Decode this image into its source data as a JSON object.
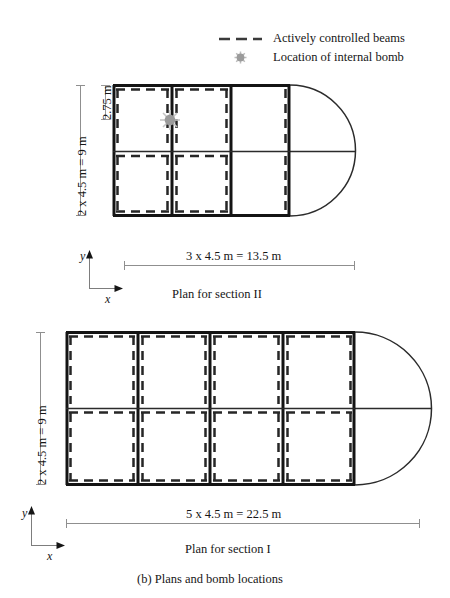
{
  "figure": {
    "caption": "(b) Plans and bomb locations",
    "legend": [
      {
        "label": "Actively controlled beams",
        "marker": "dashed-line-swatch"
      },
      {
        "label": "Location of internal bomb",
        "marker": "bomb-starburst-icon"
      }
    ],
    "colors": {
      "line": "#161616",
      "thin_line": "#2b2b2b",
      "dimension_line": "#8a8a8a",
      "bomb_marker": "#9b9b9b",
      "legend_dash": "#3a3a3a",
      "background": "#ffffff"
    },
    "plans": [
      {
        "id": "section-II",
        "title": "Plan for section II",
        "horizontal_dimension": "3 x 4.5 m = 13.5 m",
        "vertical_dimension": "2 x 4.5 m = 9 m",
        "offset_dimension": "2.75 m",
        "bays_x": 2,
        "bays_y": 2,
        "has_round_end": true,
        "bomb_count": 1,
        "axis": {
          "y": "y",
          "x": "x"
        }
      },
      {
        "id": "section-I",
        "title": "Plan for section I",
        "horizontal_dimension": "5 x 4.5 m = 22.5 m",
        "vertical_dimension": "2 x 4.5 m = 9 m",
        "bays_x": 4,
        "bays_y": 2,
        "has_round_end": true,
        "bomb_count": 0,
        "axis": {
          "y": "y",
          "x": "x"
        }
      }
    ]
  }
}
